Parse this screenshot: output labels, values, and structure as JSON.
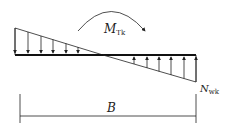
{
  "diagram": {
    "moment_label": {
      "main": "M",
      "sub": "Tk"
    },
    "axial_label": {
      "main": "N",
      "sub": "wk"
    },
    "width_label": "B",
    "stroke_color": "#222222"
  }
}
